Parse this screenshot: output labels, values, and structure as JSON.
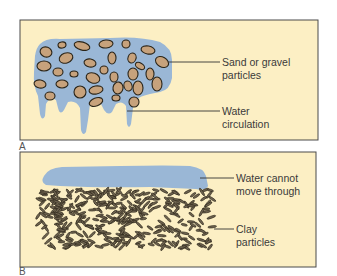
{
  "colors": {
    "panel_fill": "#fcefc4",
    "panel_border": "#4a4a4a",
    "water": "#9ab7d6",
    "sand": "#c7a27c",
    "outline": "#2a2418",
    "clay": "#6f6450",
    "leader": "#333333",
    "text": "#3a3a3a"
  },
  "panels": [
    {
      "id": "A",
      "letter": "A",
      "labels": [
        {
          "lines": [
            "Sand or gravel",
            "particles"
          ]
        },
        {
          "lines": [
            "Water",
            "circulation"
          ]
        }
      ]
    },
    {
      "id": "B",
      "letter": "B",
      "labels": [
        {
          "lines": [
            "Water cannot",
            "move through"
          ]
        },
        {
          "lines": [
            "Clay",
            "particles"
          ]
        }
      ]
    }
  ]
}
